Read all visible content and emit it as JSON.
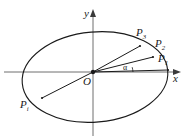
{
  "figure": {
    "name": "ellipse-rays-diagram",
    "background_color": "#ffffff",
    "stroke_color": "#1a1a1a",
    "axis_color": "#6e6e6e",
    "width": 187,
    "height": 140
  },
  "axes": {
    "x_label": "x",
    "y_label": "y",
    "origin_label": "O",
    "x_axis": {
      "x1": 4,
      "y1": 72,
      "x2": 181,
      "y2": 72
    },
    "y_axis": {
      "x1": 93,
      "y1": 136,
      "x2": 93,
      "y2": 9
    }
  },
  "ellipse": {
    "center_x": 95,
    "center_y": 77,
    "radius_x": 73,
    "radius_y": 45,
    "rotation_deg": -5
  },
  "angle": {
    "label": "α",
    "label_x": 123,
    "label_y": 66,
    "arc_start_deg": 0,
    "arc_end_deg": 9
  },
  "points": [
    {
      "id": "P1",
      "label_base": "P",
      "label_sub": "1",
      "px": 168,
      "py": 70,
      "label_x": 158,
      "label_y": 54,
      "ray": true
    },
    {
      "id": "P2",
      "label_base": "P",
      "label_sub": "2",
      "px": 153,
      "py": 57,
      "label_x": 155,
      "label_y": 39,
      "ray": true
    },
    {
      "id": "P3",
      "label_base": "P",
      "label_sub": "3",
      "px": 140,
      "py": 46,
      "label_x": 136,
      "label_y": 28,
      "ray": true
    },
    {
      "id": "Pi",
      "label_base": "P",
      "label_sub": "i",
      "px": 42,
      "py": 98,
      "label_x": 20,
      "label_y": 100,
      "ray": true
    }
  ],
  "origin": {
    "x": 93,
    "y": 72,
    "label_x": 83,
    "label_y": 76
  }
}
